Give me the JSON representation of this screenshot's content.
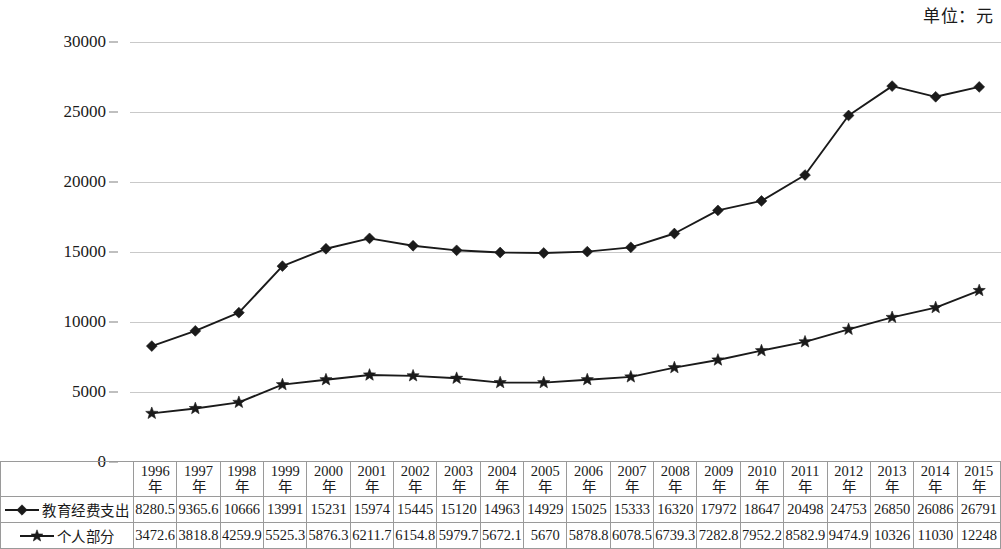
{
  "unit_caption": "单位：元",
  "axis": {
    "y_ticks": [
      0,
      5000,
      10000,
      15000,
      20000,
      25000,
      30000
    ],
    "y_tick_labels": [
      "0",
      "5000",
      "10000",
      "15000",
      "20000",
      "25000",
      "30000"
    ],
    "y_min": 0,
    "y_max": 30000
  },
  "legend": [
    {
      "label": "教育经费支出",
      "marker": "diamond-marker-icon",
      "color": "#1a1a1a"
    },
    {
      "label": "个人部分",
      "marker": "star-marker-icon",
      "color": "#1a1a1a"
    }
  ],
  "years": [
    "1996\n年",
    "1997\n年",
    "1998\n年",
    "1999\n年",
    "2000\n年",
    "2001\n年",
    "2002\n年",
    "2003\n年",
    "2004\n年",
    "2005\n年",
    "2006\n年",
    "2007\n年",
    "2008\n年",
    "2009\n年",
    "2010\n年",
    "2011\n年",
    "2012\n年",
    "2013\n年",
    "2014\n年",
    "2015\n年"
  ],
  "chart_data": {
    "type": "line",
    "title": "",
    "xlabel": "",
    "ylabel": "",
    "ylim": [
      0,
      30000
    ],
    "grid": true,
    "legend_position": "row-header-left",
    "categories": [
      "1996年",
      "1997年",
      "1998年",
      "1999年",
      "2000年",
      "2001年",
      "2002年",
      "2003年",
      "2004年",
      "2005年",
      "2006年",
      "2007年",
      "2008年",
      "2009年",
      "2010年",
      "2011年",
      "2012年",
      "2013年",
      "2014年",
      "2015年"
    ],
    "series": [
      {
        "name": "教育经费支出",
        "marker": "diamond",
        "values": [
          8280.5,
          9365.6,
          10666,
          13991,
          15231,
          15974,
          15445,
          15120,
          14963,
          14929,
          15025,
          15333,
          16320,
          17972,
          18647,
          20498,
          24753,
          26850,
          26086,
          26791
        ],
        "labels": [
          "8280.5",
          "9365.6",
          "10666",
          "13991",
          "15231",
          "15974",
          "15445",
          "15120",
          "14963",
          "14929",
          "15025",
          "15333",
          "16320",
          "17972",
          "18647",
          "20498",
          "24753",
          "26850",
          "26086",
          "26791"
        ]
      },
      {
        "name": "个人部分",
        "marker": "star",
        "values": [
          3472.6,
          3818.8,
          4259.9,
          5525.3,
          5876.3,
          6211.7,
          6154.8,
          5979.7,
          5672.1,
          5670,
          5878.8,
          6078.5,
          6739.3,
          7282.8,
          7952.2,
          8582.9,
          9474.9,
          10326,
          11030,
          12248
        ],
        "labels": [
          "3472.6",
          "3818.8",
          "4259.9",
          "5525.3",
          "5876.3",
          "6211.7",
          "6154.8",
          "5979.7",
          "5672.1",
          "5670",
          "5878.8",
          "6078.5",
          "6739.3",
          "7282.8",
          "7952.2",
          "8582.9",
          "9474.9",
          "10326",
          "11030",
          "12248"
        ]
      }
    ]
  }
}
